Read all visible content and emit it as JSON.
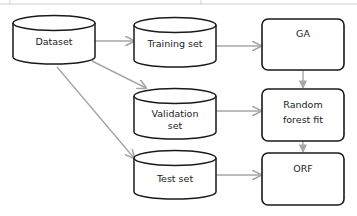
{
  "diagram": {
    "colors": {
      "stroke": "#1a1a1a",
      "arrow": "#a6a6a6",
      "border": "#c8c8c8"
    },
    "nodes": {
      "dataset": {
        "label": "Dataset",
        "shape": "cylinder"
      },
      "training": {
        "label": "Training set",
        "shape": "cylinder"
      },
      "validation": {
        "label_line1": "Validation",
        "label_line2": "set",
        "shape": "cylinder"
      },
      "test": {
        "label": "Test set",
        "shape": "cylinder"
      },
      "ga": {
        "label": "GA",
        "shape": "rounded-rect"
      },
      "rf": {
        "label_line1": "Random",
        "label_line2": "forest fit",
        "shape": "rounded-rect"
      },
      "orf": {
        "label": "ORF",
        "shape": "rounded-rect"
      }
    },
    "edges": [
      {
        "from": "dataset",
        "to": "training"
      },
      {
        "from": "dataset",
        "to": "validation"
      },
      {
        "from": "dataset",
        "to": "test"
      },
      {
        "from": "training",
        "to": "ga"
      },
      {
        "from": "validation",
        "to": "rf"
      },
      {
        "from": "test",
        "to": "orf"
      },
      {
        "from": "ga",
        "to": "rf"
      },
      {
        "from": "rf",
        "to": "orf"
      }
    ]
  }
}
